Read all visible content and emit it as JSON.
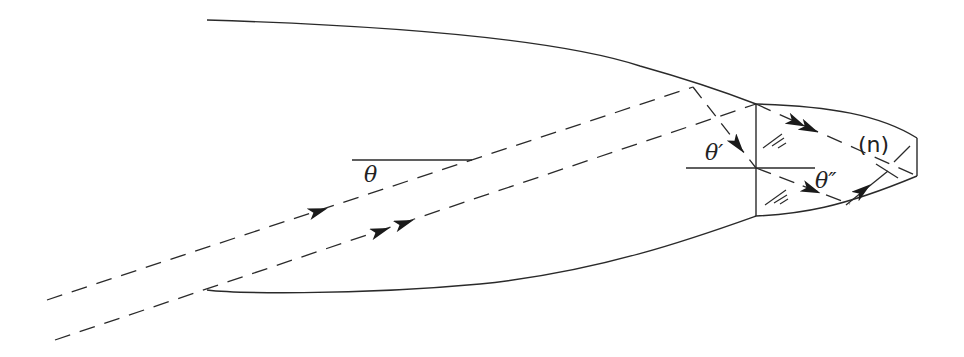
{
  "diagram": {
    "labels": {
      "theta": "θ",
      "theta_prime": "θ′",
      "theta_double_prime": "θ″",
      "index": "(n)"
    },
    "elements": {
      "outer_boundary": "curved horn-shaped outer surface (top and bottom)",
      "interface": "vertical interface line into tip region",
      "normal_line": "horizontal normal line at interface",
      "reference_line": "horizontal reference line for incidence angle θ",
      "rays": [
        {
          "name": "single-arrow ray",
          "arrows": 1,
          "style": "dashed"
        },
        {
          "name": "double-arrow ray",
          "arrows": 2,
          "style": "dashed"
        }
      ],
      "hatch_marks": 2
    },
    "colors": {
      "stroke": "#2a2a2a",
      "background": "#ffffff"
    }
  }
}
